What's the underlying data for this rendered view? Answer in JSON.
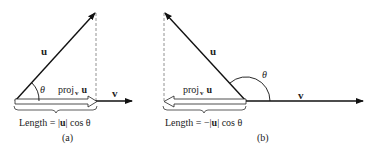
{
  "panel_a": {
    "u_label": "u",
    "v_label": "v",
    "theta_label": "θ",
    "proj_label": "proj",
    "proj_sub": "v",
    "proj_u": "u",
    "length_prefix": "Length = |",
    "length_u": "u",
    "length_suffix": "| cos θ",
    "caption": "(a)"
  },
  "panel_b": {
    "u_label": "u",
    "v_label": "v",
    "theta_label": "θ",
    "proj_label": "proj",
    "proj_sub": "v",
    "proj_u": "u",
    "length_prefix": "Length = −|",
    "length_u": "u",
    "length_suffix": "| cos θ",
    "caption": "(b)"
  }
}
